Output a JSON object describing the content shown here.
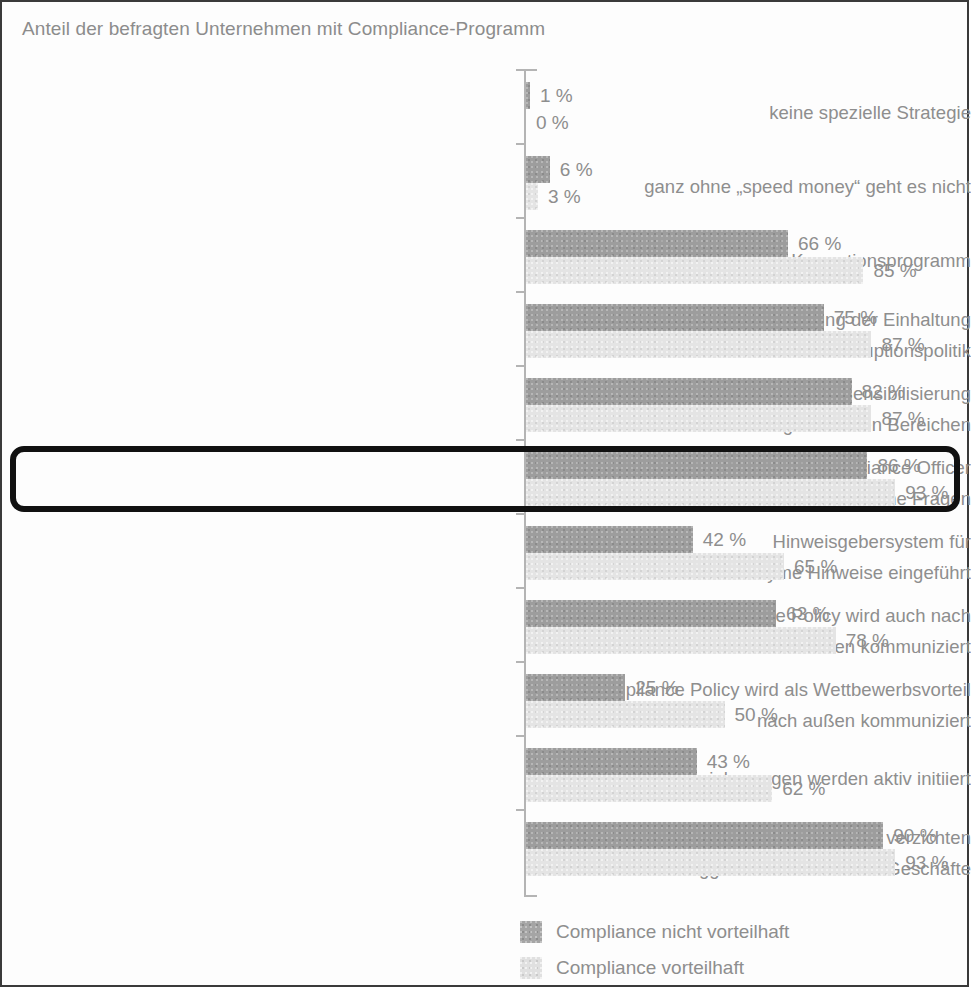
{
  "chart_data": {
    "type": "bar",
    "title": "Anteil der befragten Unternehmen mit Compliance-Programm",
    "orientation": "horizontal",
    "xlabel": "",
    "ylabel": "",
    "xlim": [
      0,
      100
    ],
    "grid": false,
    "value_suffix": "%",
    "legend_position": "bottom-right",
    "categories": [
      "keine spezielle Strategie",
      "ganz ohne „speed money“ geht es nicht",
      "Anti-Korruptionsprogramm",
      "regelmäßige Überprüfung der Einhaltung\nunserer Anti-Korruptionspolitik",
      "regelmäßige Schulung und Sensibilisierung\nin gefährdeten Bereichen",
      "Vorhandensein eines Compliance Officer\nbzw. einer Hotline für vertrauliche Fragen",
      "Hinweisgebersystem für\nanonyme Hinweise eingeführt",
      "Compliance Policy wird auch nach\naußen kommuniziert",
      "Compliance Policy wird als Wettbewerbsvorteil\nnach außen kommuniziert",
      "Integritätsvereinbarungen werden aktiv initiiert",
      "Wir machen keine Kompromisse und verzichten\nggf. auch auf lukrative Geschäfte"
    ],
    "series": [
      {
        "name": "Compliance nicht vorteilhaft",
        "color": "#9d9d9d",
        "values": [
          1,
          6,
          66,
          75,
          82,
          86,
          42,
          63,
          25,
          43,
          90
        ]
      },
      {
        "name": "Compliance vorteilhaft",
        "color": "#e4e4e4",
        "values": [
          0,
          3,
          85,
          87,
          87,
          93,
          65,
          78,
          50,
          62,
          93
        ]
      }
    ],
    "highlighted_category_index": 5
  },
  "rows": [
    {
      "label_line1": "keine spezielle Strategie",
      "label_line2": "",
      "dark": 1,
      "light": 0,
      "dark_text": "1 %",
      "light_text": "0 %"
    },
    {
      "label_line1": "ganz ohne „speed money“ geht es nicht",
      "label_line2": "",
      "dark": 6,
      "light": 3,
      "dark_text": "6 %",
      "light_text": "3 %"
    },
    {
      "label_line1": "Anti-Korruptionsprogramm",
      "label_line2": "",
      "dark": 66,
      "light": 85,
      "dark_text": "66 %",
      "light_text": "85 %"
    },
    {
      "label_line1": "regelmäßige Überprüfung der Einhaltung",
      "label_line2": "unserer Anti-Korruptionspolitik",
      "dark": 75,
      "light": 87,
      "dark_text": "75 %",
      "light_text": "87 %"
    },
    {
      "label_line1": "regelmäßige Schulung und Sensibilisierung",
      "label_line2": "in gefährdeten Bereichen",
      "dark": 82,
      "light": 87,
      "dark_text": "82 %",
      "light_text": "87 %"
    },
    {
      "label_line1": "Vorhandensein eines Compliance Officer",
      "label_line2": "bzw. einer Hotline für vertrauliche Fragen",
      "dark": 86,
      "light": 93,
      "dark_text": "86 %",
      "light_text": "93 %"
    },
    {
      "label_line1": "Hinweisgebersystem für",
      "label_line2": "anonyme Hinweise eingeführt",
      "dark": 42,
      "light": 65,
      "dark_text": "42 %",
      "light_text": "65 %"
    },
    {
      "label_line1": "Compliance Policy wird auch nach",
      "label_line2": "außen kommuniziert",
      "dark": 63,
      "light": 78,
      "dark_text": "63 %",
      "light_text": "78 %"
    },
    {
      "label_line1": "Compliance Policy wird als Wettbewerbsvorteil",
      "label_line2": "nach außen kommuniziert",
      "dark": 25,
      "light": 50,
      "dark_text": "25 %",
      "light_text": "50 %"
    },
    {
      "label_line1": "Integritätsvereinbarungen werden aktiv initiiert",
      "label_line2": "",
      "dark": 43,
      "light": 62,
      "dark_text": "43 %",
      "light_text": "62 %"
    },
    {
      "label_line1": "Wir machen keine Kompromisse und verzichten",
      "label_line2": "ggf. auch auf lukrative Geschäfte",
      "dark": 90,
      "light": 93,
      "dark_text": "90 %",
      "light_text": "93 %"
    }
  ],
  "legend": {
    "items": [
      {
        "label": "Compliance nicht vorteilhaft",
        "swatch": "dark",
        "color": "#9d9d9d"
      },
      {
        "label": "Compliance vorteilhaft",
        "swatch": "light",
        "color": "#e4e4e4"
      }
    ]
  },
  "style": {
    "text_color": "#8e8e8e",
    "axis_color": "#b4b4b4",
    "highlight_border_color": "#111111",
    "frame_border_color": "#3a3a3a",
    "background": "#fdfdfd"
  }
}
